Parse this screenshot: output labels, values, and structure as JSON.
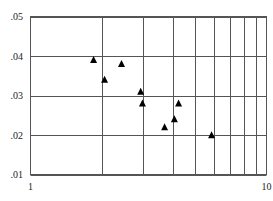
{
  "chart_data": {
    "type": "scatter",
    "title": "",
    "xlabel": "",
    "ylabel": "",
    "xscale": "log",
    "xlim": [
      1,
      10
    ],
    "ylim": [
      0.01,
      0.05
    ],
    "grid": true,
    "legend": null,
    "x_tick_labels": [
      {
        "value": 1,
        "label": "1"
      },
      {
        "value": 10,
        "label": "10"
      }
    ],
    "x_grid_values": [
      2,
      3,
      4,
      5,
      6,
      7,
      8,
      9
    ],
    "y_tick_labels": [
      {
        "value": 0.05,
        "label": ".05"
      },
      {
        "value": 0.04,
        "label": ".04"
      },
      {
        "value": 0.03,
        "label": ".03"
      },
      {
        "value": 0.02,
        "label": ".02"
      },
      {
        "value": 0.01,
        "label": ".01"
      }
    ],
    "marker": "triangle-up",
    "marker_color": "#000000",
    "series": [
      {
        "name": "data",
        "points": [
          {
            "x": 1.85,
            "y": 0.039
          },
          {
            "x": 2.06,
            "y": 0.034
          },
          {
            "x": 2.43,
            "y": 0.038
          },
          {
            "x": 2.93,
            "y": 0.031
          },
          {
            "x": 2.98,
            "y": 0.028
          },
          {
            "x": 3.7,
            "y": 0.022
          },
          {
            "x": 4.07,
            "y": 0.024
          },
          {
            "x": 4.24,
            "y": 0.028
          },
          {
            "x": 5.85,
            "y": 0.02
          }
        ]
      }
    ]
  },
  "style": {
    "grid_color": "#555555",
    "frame_color": "#555555",
    "text_color": "#222222",
    "background": "#ffffff"
  }
}
